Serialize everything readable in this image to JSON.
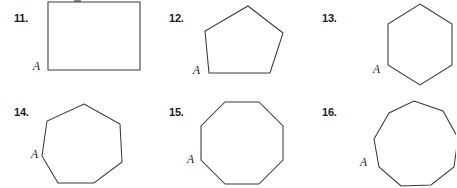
{
  "page": {
    "kind": "geometry-exercise-figures",
    "background_color": "#ffffff",
    "stroke_color": "#3a3a3a",
    "label_color": "#1a1a1a",
    "vertex_label": "A"
  },
  "exercises": [
    {
      "number": "11.",
      "shape": "rectangle",
      "sides": 4,
      "vertex_label": "A",
      "clipped": "top"
    },
    {
      "number": "12.",
      "shape": "pentagon",
      "sides": 5,
      "vertex_label": "A",
      "clipped": "none"
    },
    {
      "number": "13.",
      "shape": "hexagon",
      "sides": 6,
      "vertex_label": "A",
      "clipped": "bottom"
    },
    {
      "number": "14.",
      "shape": "heptagon",
      "sides": 7,
      "vertex_label": "A",
      "clipped": "bottom"
    },
    {
      "number": "15.",
      "shape": "octagon",
      "sides": 8,
      "vertex_label": "A",
      "clipped": "bottom"
    },
    {
      "number": "16.",
      "shape": "nonagon",
      "sides": 9,
      "vertex_label": "A",
      "clipped": "right-bottom"
    }
  ]
}
